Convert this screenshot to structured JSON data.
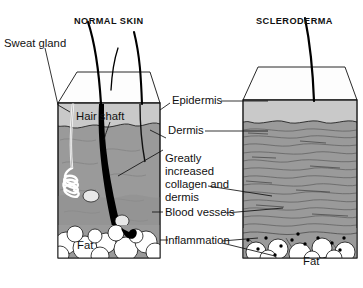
{
  "figure": {
    "type": "medical-illustration",
    "panels": [
      {
        "id": "normal",
        "title": "NORMAL SKIN",
        "labels": [
          "Sweat gland",
          "Hair shaft",
          "Fat"
        ]
      },
      {
        "id": "scleroderma",
        "title": "SCLERODERMA",
        "labels": [
          "Fat"
        ]
      }
    ]
  },
  "titles": {
    "normal": "NORMAL SKIN",
    "scleroderma": "SCLERODERMA"
  },
  "labels": {
    "sweat_gland": "Sweat gland",
    "hair_shaft": "Hair shaft",
    "fat_left": "Fat",
    "fat_right": "Fat",
    "epidermis": "Epidermis",
    "dermis": "Dermis",
    "greatly_l1": "Greatly",
    "greatly_l2": "increased",
    "greatly_l3": "collagen and",
    "greatly_l4": "dermis",
    "blood_vessels": "Blood vessels",
    "inflammation": "Inflammation"
  },
  "colors": {
    "ink": "#111111",
    "epidermis_fill": "#c9c9c9",
    "dermis_fill": "#9a9a9a",
    "dermis_deep": "#8a8a8a",
    "fat_fill": "#ffffff",
    "top_face": "#fdfdfd",
    "hair": "#000000",
    "background": "#ffffff"
  }
}
